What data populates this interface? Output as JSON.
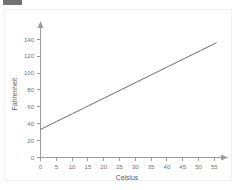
{
  "top_mark": {
    "label": "watermark-bar"
  },
  "chart_data": {
    "type": "line",
    "title": "",
    "xlabel": "Celsius",
    "ylabel": "Fahrenheit",
    "xlim": [
      0,
      57
    ],
    "ylim": [
      0,
      150
    ],
    "xticks": [
      0,
      5,
      10,
      15,
      20,
      25,
      30,
      35,
      40,
      45,
      50,
      55
    ],
    "yticks": [
      0,
      20,
      40,
      60,
      80,
      100,
      120,
      140
    ],
    "xtick_labels": [
      "0",
      "5",
      "10",
      "15",
      "20",
      "25",
      "30",
      "35",
      "40",
      "45",
      "50",
      "55"
    ],
    "ytick_labels": [
      "0",
      "20",
      "40",
      "60",
      "80",
      "100",
      "120",
      "140"
    ],
    "grid": false,
    "legend": false,
    "series": [
      {
        "name": "Celsius to Fahrenheit",
        "x": [
          0,
          5,
          10,
          15,
          20,
          25,
          30,
          35,
          40,
          45,
          50,
          55
        ],
        "values": [
          32,
          41,
          50,
          59,
          68,
          77,
          86,
          95,
          104,
          113,
          122,
          131
        ]
      }
    ],
    "axis_arrows": true,
    "line_color": "#58585c",
    "axis_color": "#9a9a9a",
    "tick_label_color": "#6e6e6e",
    "axis_title_color": "#555555",
    "background": "#ffffff",
    "border_color": "#eef0f2"
  }
}
